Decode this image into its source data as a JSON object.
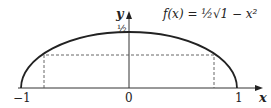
{
  "diagram": {
    "function_label": "f(x) = ½√1 − x²",
    "y_axis_label": "y",
    "x_axis_label": "x",
    "y_tick": "½",
    "x_ticks": [
      "−1",
      "0",
      "1"
    ],
    "curve": "upper half of ellipse f(x) = ½√(1 − x²), x from −1 to 1",
    "inscribed_rectangle": "dashed rectangle under the curve"
  }
}
